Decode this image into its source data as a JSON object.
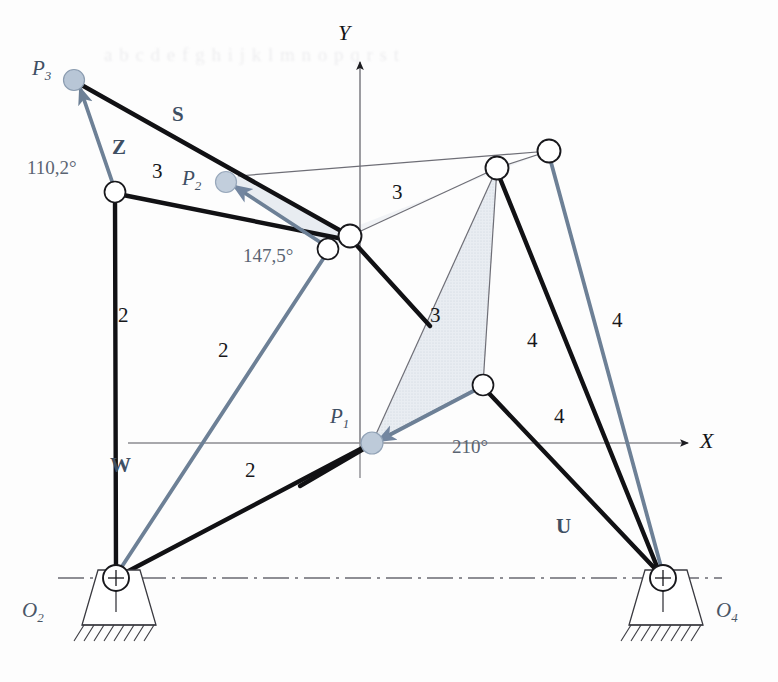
{
  "figure": {
    "type": "kinematic-diagram",
    "ghost_text": "a b c d e f g h i j k l m n o p q r s t"
  },
  "axes": {
    "x_label": "X",
    "y_label": "Y",
    "origin_px": [
      360,
      443
    ]
  },
  "vectors": [
    {
      "name": "W",
      "label": "W",
      "px": [
        110,
        455
      ]
    },
    {
      "name": "Z",
      "label": "Z",
      "px": [
        112,
        137
      ]
    },
    {
      "name": "S",
      "label": "S",
      "px": [
        172,
        104
      ]
    },
    {
      "name": "U",
      "label": "U",
      "px": [
        556,
        516
      ]
    }
  ],
  "angles": [
    {
      "label": "110,2°",
      "px": [
        27,
        158
      ]
    },
    {
      "label": "147,5°",
      "px": [
        243,
        246
      ]
    },
    {
      "label": "210°",
      "px": [
        452,
        437
      ]
    }
  ],
  "link_numbers": [
    {
      "label": "2",
      "px": [
        118,
        305
      ]
    },
    {
      "label": "2",
      "px": [
        218,
        340
      ]
    },
    {
      "label": "2",
      "px": [
        245,
        460
      ]
    },
    {
      "label": "3",
      "px": [
        152,
        161
      ]
    },
    {
      "label": "3",
      "px": [
        392,
        182
      ]
    },
    {
      "label": "3",
      "px": [
        430,
        305
      ]
    },
    {
      "label": "4",
      "px": [
        527,
        330
      ]
    },
    {
      "label": "4",
      "px": [
        554,
        406
      ]
    },
    {
      "label": "4",
      "px": [
        612,
        310
      ]
    }
  ],
  "precision_points": [
    {
      "id": "P1",
      "name": "P",
      "sub": "1",
      "px": [
        372,
        443
      ],
      "label_px": [
        330,
        410
      ]
    },
    {
      "id": "P2",
      "name": "P",
      "sub": "2",
      "px": [
        226,
        182
      ],
      "label_px": [
        182,
        172
      ]
    },
    {
      "id": "P3",
      "name": "P",
      "sub": "3",
      "px": [
        74,
        80
      ],
      "label_px": [
        32,
        62
      ]
    }
  ],
  "ground_pivots": [
    {
      "id": "O2",
      "name": "O",
      "sub": "2",
      "px": [
        116,
        578
      ],
      "label_px": [
        22,
        604
      ]
    },
    {
      "id": "O4",
      "name": "O",
      "sub": "4",
      "px": [
        663,
        578
      ],
      "label_px": [
        716,
        604
      ]
    }
  ],
  "joints_px": [
    [
      115,
      192
    ],
    [
      328,
      249
    ],
    [
      350,
      236
    ],
    [
      497,
      168
    ],
    [
      549,
      151
    ],
    [
      483,
      385
    ]
  ],
  "colors": {
    "link_black": "#111114",
    "link_blue": "#6d8096",
    "axis_gray": "#8b8b90",
    "thin_line": "#6e6e76",
    "shade_fill": "#dfe4ea",
    "point_fill": "#b8c6d6",
    "vector_text": "#3f4f63",
    "angle_text": "#5a6472",
    "ground_line": "#6a6a72"
  }
}
